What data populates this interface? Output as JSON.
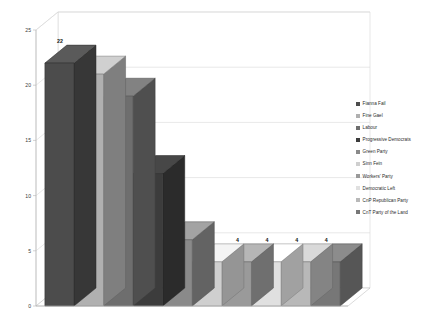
{
  "chart_data": {
    "type": "bar",
    "title": "",
    "subtitle": "",
    "xlabel": "",
    "ylabel": "",
    "ylim": [
      0,
      25
    ],
    "ytick_values": [
      0,
      5,
      10,
      15,
      20,
      25
    ],
    "ytick_labels": [
      "0",
      "5",
      "10",
      "15",
      "20",
      "25"
    ],
    "grid": true,
    "grid_axis": "y",
    "legend_position": "right",
    "three_d": true,
    "categories": [
      "Fianna Fail",
      "Fine Gael",
      "Labour",
      "Progressive Democrats",
      "Green Party",
      "Sinn Fein",
      "Workers' Party",
      "Democratic Left",
      "CnP Republican Party",
      "CnT Party of the Land"
    ],
    "values": [
      22,
      21,
      19,
      12,
      6,
      4,
      4,
      4,
      4,
      4
    ],
    "data_labels": [
      "22",
      "21",
      "19",
      "12",
      "6",
      "4",
      "4",
      "4",
      "4",
      "4"
    ],
    "bar_colors": [
      "#4c4c4c",
      "#b0b0b0",
      "#6e6e6e",
      "#3c3c3c",
      "#8a8a8a",
      "#cfcfcf",
      "#9a9a9a",
      "#e0e0e0",
      "#b8b8b8",
      "#777777"
    ]
  },
  "legend": {
    "items": [
      {
        "label": "Fianna Fail",
        "color": "#4c4c4c"
      },
      {
        "label": "Fine Gael",
        "color": "#b0b0b0"
      },
      {
        "label": "Labour",
        "color": "#6e6e6e"
      },
      {
        "label": "Progressive Democrats",
        "color": "#3c3c3c"
      },
      {
        "label": "Green Party",
        "color": "#8a8a8a"
      },
      {
        "label": "Sinn Fein",
        "color": "#cfcfcf"
      },
      {
        "label": "Workers' Party",
        "color": "#9a9a9a"
      },
      {
        "label": "Democratic Left",
        "color": "#e0e0e0"
      },
      {
        "label": "CnP Republican Party",
        "color": "#b8b8b8"
      },
      {
        "label": "CnT Party of the Land",
        "color": "#777777"
      }
    ]
  },
  "style": {
    "plot_background": "#ffffff",
    "gridline_color": "#d9d9d9",
    "axis_color": "#b5b5b5",
    "wall_color": "#ffffff",
    "floor_color": "#ffffff"
  }
}
